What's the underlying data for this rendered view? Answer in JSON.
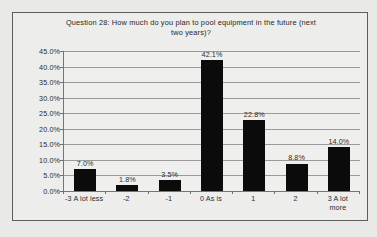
{
  "chart_data": {
    "type": "bar",
    "title": "Question 28: How much do you plan to pool equipment in the future (next two years)?",
    "title_line1": "Question 28: How much do you plan to pool equipment in the future (next",
    "title_line2": "two years)?",
    "xlabel": "",
    "ylabel": "",
    "categories": [
      "-3 A lot less",
      "-2",
      "-1",
      "0 As is",
      "1",
      "2",
      "3 A lot more"
    ],
    "category_lines": [
      [
        "-3 A lot less"
      ],
      [
        "-2"
      ],
      [
        "-1"
      ],
      [
        "0 As is"
      ],
      [
        "1"
      ],
      [
        "2"
      ],
      [
        "3 A lot",
        "more"
      ]
    ],
    "values": [
      7.0,
      1.8,
      3.5,
      42.1,
      22.8,
      8.8,
      14.0
    ],
    "data_labels": [
      "7.0%",
      "1.8%",
      "3.5%",
      "42.1%",
      "22.8%",
      "8.8%",
      "14.0%"
    ],
    "ylim": [
      0,
      45
    ],
    "ytick_values": [
      0,
      5,
      10,
      15,
      20,
      25,
      30,
      35,
      40,
      45
    ],
    "ytick_labels": [
      "0.0%",
      "5.0%",
      "10.0%",
      "15.0%",
      "20.0%",
      "25.0%",
      "30.0%",
      "35.0%",
      "40.0%",
      "45.0%"
    ],
    "grid": true,
    "legend": null,
    "bar_color": "#0b0b0b",
    "plot_background": "#efefed",
    "frame_background": "#ededeb",
    "page_background": "#e9e9e7",
    "axis_color": "#757575",
    "gridline_color": "#9a9a9a",
    "text_color": "#2b2b2e"
  }
}
